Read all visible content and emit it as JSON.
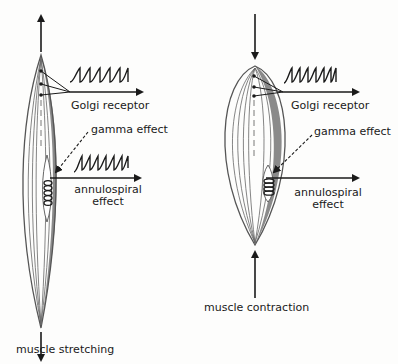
{
  "diagram": {
    "left_panel": {
      "title": "muscle stretching",
      "golgi_label": "Golgi receptor",
      "gamma_label": "gamma effect",
      "annulo_label_line1": "annulospiral",
      "annulo_label_line2": "effect"
    },
    "right_panel": {
      "title": "muscle contraction",
      "golgi_label": "Golgi receptor",
      "gamma_label": "gamma effect",
      "annulo_label_line1": "annulospiral",
      "annulo_label_line2": "effect"
    },
    "colors": {
      "ink": "#1a1a1a",
      "muscle_shade": "#8a8a8a",
      "background": "#fdfdfc"
    }
  }
}
